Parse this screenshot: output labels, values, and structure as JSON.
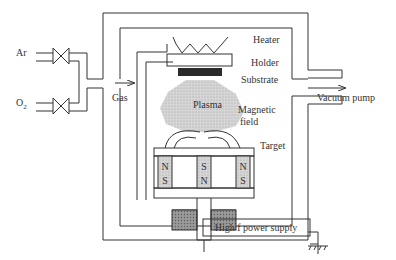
{
  "diagram": {
    "labels": {
      "ar": "Ar",
      "o2_main": "O",
      "o2_sub": "2",
      "gas": "Gas",
      "heater": "Heater",
      "holder": "Holder",
      "substrate": "Substrate",
      "plasma": "Plasma",
      "magnetic_line1": "Magnetic",
      "magnetic_line2": "field",
      "target": "Target",
      "vacuum_pump": "Vacuum pump",
      "power_supply": "High f power supply"
    },
    "magnets": [
      {
        "top": "N",
        "bottom": "S"
      },
      {
        "top": "S",
        "bottom": "N"
      },
      {
        "top": "N",
        "bottom": "S"
      }
    ],
    "colors": {
      "line": "#333333",
      "substrate": "#2a2a2a",
      "plasma": "#c8c8c8",
      "magnet_fill": "#d9d9d9",
      "insulator": "#8c8c8c"
    }
  }
}
